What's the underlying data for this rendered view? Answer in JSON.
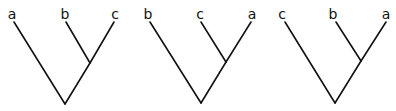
{
  "diagram": {
    "type": "cladograms",
    "trees": [
      {
        "id": "tree-1",
        "leaves": [
          {
            "label": "a",
            "lx": 12,
            "ly": 19,
            "x": 14,
            "y": 22
          },
          {
            "label": "b",
            "lx": 65,
            "ly": 19,
            "x": 66,
            "y": 22
          },
          {
            "label": "c",
            "lx": 115,
            "ly": 19,
            "x": 114,
            "y": 22
          }
        ],
        "node": {
          "x": 90,
          "y": 63
        },
        "root": {
          "x": 65,
          "y": 104
        },
        "grouping": "(a,(b,c))"
      },
      {
        "id": "tree-2",
        "leaves": [
          {
            "label": "b",
            "lx": 148,
            "ly": 19,
            "x": 150,
            "y": 22
          },
          {
            "label": "c",
            "lx": 200,
            "ly": 19,
            "x": 201,
            "y": 22
          },
          {
            "label": "a",
            "lx": 252,
            "ly": 19,
            "x": 251,
            "y": 22
          }
        ],
        "node": {
          "x": 226,
          "y": 62
        },
        "root": {
          "x": 201,
          "y": 103
        },
        "grouping": "(b,(c,a))"
      },
      {
        "id": "tree-3",
        "leaves": [
          {
            "label": "c",
            "lx": 282,
            "ly": 19,
            "x": 285,
            "y": 22
          },
          {
            "label": "b",
            "lx": 333,
            "ly": 19,
            "x": 336,
            "y": 22
          },
          {
            "label": "a",
            "lx": 386,
            "ly": 19,
            "x": 386,
            "y": 22
          }
        ],
        "node": {
          "x": 361,
          "y": 61
        },
        "root": {
          "x": 335,
          "y": 103
        },
        "grouping": "(c,(b,a))"
      }
    ]
  }
}
